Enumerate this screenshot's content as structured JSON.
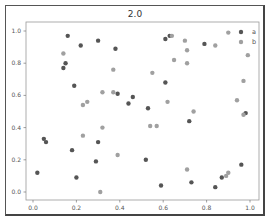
{
  "chart_data": {
    "type": "scatter",
    "title": "2.0",
    "xlabel": "",
    "ylabel": "",
    "xlim": [
      -0.03,
      1.03
    ],
    "ylim": [
      -0.05,
      1.05
    ],
    "x_ticks": [
      "0.0",
      "0.2",
      "0.4",
      "0.6",
      "0.8",
      "1.0"
    ],
    "y_ticks": [
      "0.0",
      "0.2",
      "0.4",
      "0.6",
      "0.8",
      "1.0"
    ],
    "grid": false,
    "legend_position": "upper right",
    "series": [
      {
        "name": "a",
        "color": "#555555",
        "points": [
          [
            0.16,
            0.97
          ],
          [
            0.22,
            0.91
          ],
          [
            0.3,
            0.94
          ],
          [
            0.38,
            0.89
          ],
          [
            0.15,
            0.8
          ],
          [
            0.14,
            0.77
          ],
          [
            0.61,
            0.95
          ],
          [
            0.63,
            0.97
          ],
          [
            0.19,
            0.66
          ],
          [
            0.61,
            0.68
          ],
          [
            0.46,
            0.59
          ],
          [
            0.39,
            0.61
          ],
          [
            0.44,
            0.55
          ],
          [
            0.53,
            0.52
          ],
          [
            0.79,
            0.92
          ],
          [
            0.05,
            0.33
          ],
          [
            0.06,
            0.31
          ],
          [
            0.3,
            0.31
          ],
          [
            0.18,
            0.26
          ],
          [
            0.29,
            0.19
          ],
          [
            0.52,
            0.2
          ],
          [
            0.72,
            0.44
          ],
          [
            0.98,
            0.49
          ],
          [
            0.02,
            0.12
          ],
          [
            0.2,
            0.09
          ],
          [
            0.59,
            0.04
          ],
          [
            0.73,
            0.06
          ],
          [
            0.84,
            0.03
          ],
          [
            0.87,
            0.09
          ],
          [
            0.96,
            0.17
          ]
        ]
      },
      {
        "name": "b",
        "color": "#a0a0a0",
        "points": [
          [
            0.14,
            0.86
          ],
          [
            0.37,
            0.76
          ],
          [
            0.55,
            0.74
          ],
          [
            0.64,
            0.97
          ],
          [
            0.7,
            0.94
          ],
          [
            0.71,
            0.88
          ],
          [
            0.65,
            0.82
          ],
          [
            0.71,
            0.8
          ],
          [
            0.9,
            0.99
          ],
          [
            0.84,
            0.91
          ],
          [
            0.99,
            0.85
          ],
          [
            0.97,
            0.69
          ],
          [
            0.32,
            0.62
          ],
          [
            0.37,
            0.62
          ],
          [
            0.23,
            0.54
          ],
          [
            0.25,
            0.56
          ],
          [
            0.62,
            0.56
          ],
          [
            0.74,
            0.5
          ],
          [
            0.94,
            0.57
          ],
          [
            0.97,
            0.48
          ],
          [
            0.23,
            0.35
          ],
          [
            0.32,
            0.4
          ],
          [
            0.54,
            0.41
          ],
          [
            0.57,
            0.41
          ],
          [
            0.39,
            0.23
          ],
          [
            0.71,
            0.14
          ],
          [
            0.9,
            0.12
          ],
          [
            0.89,
            0.1
          ],
          [
            0.31,
            0.0
          ]
        ]
      }
    ]
  }
}
